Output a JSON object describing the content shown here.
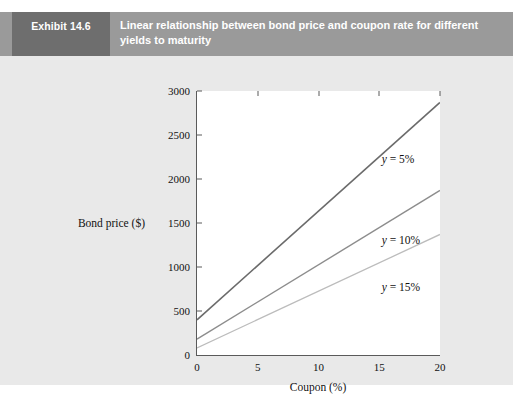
{
  "header": {
    "exhibit_tag": "Exhibit 14.6",
    "title": "Linear relationship between bond price and coupon rate for different yields to maturity",
    "tag_bg": "#6e6e6e",
    "banner_bg": "#9a9a9a",
    "text_color": "#ffffff"
  },
  "figure": {
    "background": "#e9e9e9",
    "plot_background": "#ffffff",
    "axis_color": "#5a5a5a"
  },
  "chart_data": {
    "type": "line",
    "title": "Linear relationship between bond price and coupon rate for different yields to maturity",
    "xlabel": "Coupon (%)",
    "ylabel": "Bond price ($)",
    "xlim": [
      0,
      20
    ],
    "ylim": [
      0,
      3000
    ],
    "xticks": [
      0,
      5,
      10,
      15,
      20
    ],
    "yticks": [
      0,
      500,
      1000,
      1500,
      2000,
      2500,
      3000
    ],
    "grid": false,
    "legend": "inline-annotations",
    "x": [
      0,
      20
    ],
    "series": [
      {
        "name": "y = 5%",
        "label_html": "<i>y</i> = 5%",
        "values": [
          400,
          2870
        ],
        "color": "#6b6b6b",
        "width": 1.6,
        "label_x": 15.2,
        "label_y": 2290
      },
      {
        "name": "y = 10%",
        "label_html": "<i>y</i> = 10%",
        "values": [
          180,
          1870
        ],
        "color": "#8d8d8d",
        "width": 1.4,
        "label_x": 15.2,
        "label_y": 1370
      },
      {
        "name": "y = 15%",
        "label_html": "<i>y</i> = 15%",
        "values": [
          80,
          1370
        ],
        "color": "#bcbcbc",
        "width": 1.3,
        "label_x": 15.2,
        "label_y": 845
      }
    ]
  }
}
